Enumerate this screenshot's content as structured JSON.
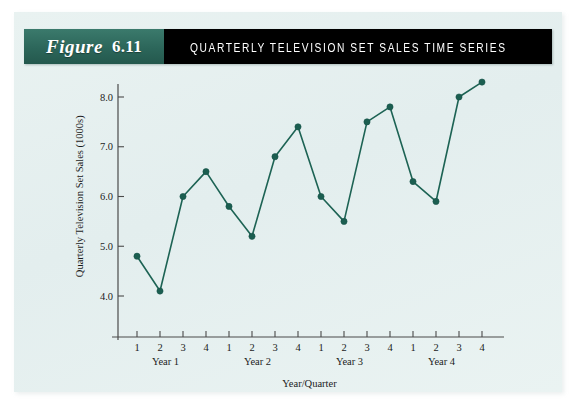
{
  "figure": {
    "label": "Figure",
    "number": "6.11",
    "title": "QUARTERLY TELEVISION SET SALES TIME SERIES"
  },
  "colors": {
    "header_green": "#2f6b5e",
    "header_black": "#000000",
    "panel_background": "#e6f0ef",
    "series": "#1b5e50",
    "axis": "#4a4a4a"
  },
  "chart_data": {
    "type": "line",
    "title": "QUARTERLY TELEVISION SET SALES TIME SERIES",
    "xlabel": "Year/Quarter",
    "ylabel": "Quarterly Television Set Sales (1000s)",
    "x": [
      1,
      2,
      3,
      4,
      5,
      6,
      7,
      8,
      9,
      10,
      11,
      12,
      13,
      14,
      15,
      16
    ],
    "categories": [
      "1",
      "2",
      "3",
      "4",
      "1",
      "2",
      "3",
      "4",
      "1",
      "2",
      "3",
      "4",
      "1",
      "2",
      "3",
      "4"
    ],
    "values": [
      4.8,
      4.1,
      6.0,
      6.5,
      5.8,
      5.2,
      6.8,
      7.4,
      6.0,
      5.5,
      7.5,
      7.8,
      6.3,
      5.9,
      8.0,
      8.3
    ],
    "series": [
      {
        "name": "Quarterly Television Set Sales (1000s)",
        "values": [
          4.8,
          4.1,
          6.0,
          6.5,
          5.8,
          5.2,
          6.8,
          7.4,
          6.0,
          5.5,
          7.5,
          7.8,
          6.3,
          5.9,
          8.0,
          8.3
        ]
      }
    ],
    "group_labels": [
      "Year 1",
      "Year 2",
      "Year 3",
      "Year 4"
    ],
    "ytick_labels": [
      "4.0",
      "5.0",
      "6.0",
      "7.0",
      "8.0"
    ],
    "ytick_values": [
      4.0,
      5.0,
      6.0,
      7.0,
      8.0
    ],
    "ylim": [
      3.55,
      8.62
    ],
    "xlim": [
      0.35,
      16.65
    ],
    "grid": false,
    "legend": "none",
    "markers": "filled-circle"
  }
}
